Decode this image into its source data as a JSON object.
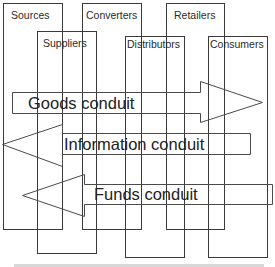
{
  "diagram": {
    "entities": [
      {
        "id": "sources",
        "label": "Sources",
        "x": 3,
        "y": 3,
        "w": 59,
        "h": 226
      },
      {
        "id": "suppliers",
        "label": "Suppliers",
        "x": 37,
        "y": 31,
        "w": 59,
        "h": 222
      },
      {
        "id": "converters",
        "label": "Converters",
        "x": 82,
        "y": 3,
        "w": 59,
        "h": 226
      },
      {
        "id": "distributors",
        "label": "Distributors",
        "x": 125,
        "y": 36,
        "w": 59,
        "h": 222
      },
      {
        "id": "retailers",
        "label": "Retailers",
        "x": 166,
        "y": 3,
        "w": 58,
        "h": 226
      },
      {
        "id": "consumers",
        "label": "Consumers",
        "x": 208,
        "y": 36,
        "w": 59,
        "h": 221
      }
    ],
    "conduits": [
      {
        "id": "goods",
        "label": "Goods conduit",
        "direction": "right"
      },
      {
        "id": "information",
        "label": "Information conduit",
        "direction": "left"
      },
      {
        "id": "funds",
        "label": "Funds conduit",
        "direction": "left"
      }
    ],
    "colors": {
      "stroke": "#3a3a3a",
      "text": "#222222",
      "background": "#ffffff"
    }
  }
}
